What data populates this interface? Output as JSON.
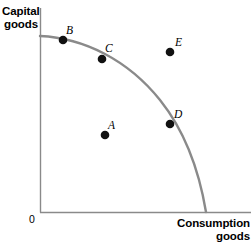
{
  "chart_data": {
    "type": "scatter",
    "title": "",
    "xlabel": "Consumption goods",
    "ylabel": "Capital goods",
    "origin_label": "0",
    "grid": false,
    "legend": null,
    "axis_color": "#8a8a8a",
    "curve_color": "#8a8a8a",
    "point_color": "#111111",
    "curve": {
      "name": "Production possibilities frontier",
      "description": "Concave-to-origin frontier from the capital-goods axis down to the consumption-goods axis",
      "y_intercept": {
        "x": 40,
        "y": 36
      },
      "x_intercept": {
        "x": 206,
        "y": 212
      },
      "path": "M 40 36 C 84 38 128 60 160 100 C 184 130 199 170 206 212"
    },
    "points": [
      {
        "label": "A",
        "x": 105,
        "y": 135,
        "label_x": 108,
        "label_y": 120,
        "position": "inside frontier"
      },
      {
        "label": "B",
        "x": 63,
        "y": 40,
        "label_x": 66,
        "label_y": 25,
        "position": "on frontier"
      },
      {
        "label": "C",
        "x": 102,
        "y": 59,
        "label_x": 105,
        "label_y": 43,
        "position": "on frontier"
      },
      {
        "label": "D",
        "x": 170,
        "y": 124,
        "label_x": 174,
        "label_y": 109,
        "position": "on frontier"
      },
      {
        "label": "E",
        "x": 170,
        "y": 52,
        "label_x": 175,
        "label_y": 37,
        "position": "outside frontier"
      }
    ],
    "axes": {
      "y_axis": {
        "x": 40,
        "y_top": 8,
        "y_bottom": 212
      },
      "x_axis": {
        "y": 212,
        "x_left": 40,
        "x_right": 251
      }
    }
  },
  "labels": {
    "capital_line1": "Capital",
    "capital_line2": "goods",
    "consumption_line1": "Consumption",
    "consumption_line2": "goods",
    "origin": "0"
  }
}
